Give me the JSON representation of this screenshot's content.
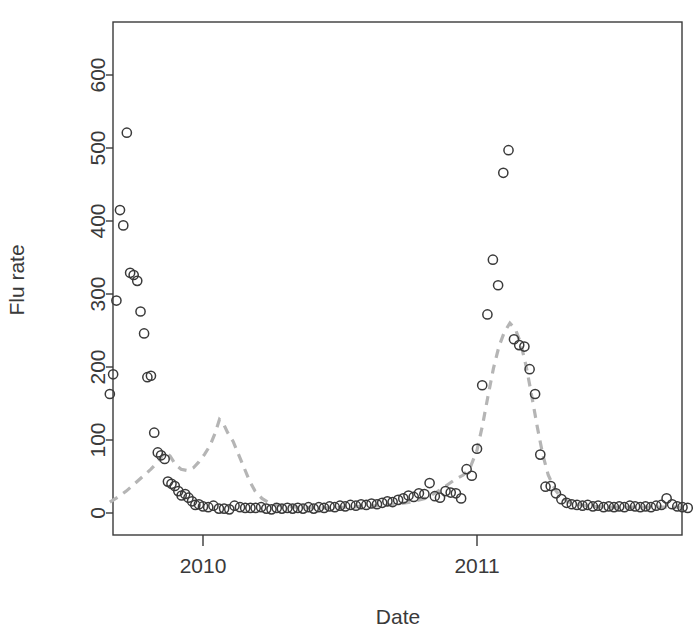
{
  "chart_data": {
    "type": "scatter",
    "title": "",
    "xlabel": "Date",
    "ylabel": "Flu rate",
    "xlim": [
      2009.63,
      2011.38
    ],
    "ylim": [
      -20,
      660
    ],
    "grid": false,
    "legend": "none",
    "x_tick_labels": [
      "2010",
      "2011"
    ],
    "x_tick_values": [
      2010,
      2011
    ],
    "y_tick_labels": [
      "0",
      "100",
      "200",
      "300",
      "400",
      "500",
      "600"
    ],
    "y_tick_values": [
      0,
      100,
      200,
      300,
      400,
      500,
      600
    ],
    "series": [
      {
        "name": "Observed flu rate",
        "type": "scatter",
        "marker": "open-circle",
        "color": "#3a3a3a",
        "points": [
          [
            2009.66,
            163
          ],
          [
            2009.672,
            190
          ],
          [
            2009.684,
            291
          ],
          [
            2009.697,
            415
          ],
          [
            2009.709,
            394
          ],
          [
            2009.722,
            521
          ],
          [
            2009.734,
            329
          ],
          [
            2009.747,
            326
          ],
          [
            2009.76,
            318
          ],
          [
            2009.772,
            276
          ],
          [
            2009.785,
            246
          ],
          [
            2009.797,
            186
          ],
          [
            2009.81,
            188
          ],
          [
            2009.822,
            110
          ],
          [
            2009.835,
            83
          ],
          [
            2009.847,
            79
          ],
          [
            2009.86,
            74
          ],
          [
            2009.872,
            43
          ],
          [
            2009.885,
            40
          ],
          [
            2009.897,
            37
          ],
          [
            2009.91,
            30
          ],
          [
            2009.922,
            24
          ],
          [
            2009.935,
            26
          ],
          [
            2009.947,
            21
          ],
          [
            2009.96,
            16
          ],
          [
            2009.972,
            11
          ],
          [
            2009.985,
            12
          ],
          [
            2010.0,
            9
          ],
          [
            2010.019,
            8
          ],
          [
            2010.038,
            10
          ],
          [
            2010.058,
            6
          ],
          [
            2010.077,
            6
          ],
          [
            2010.096,
            5
          ],
          [
            2010.115,
            10
          ],
          [
            2010.135,
            8
          ],
          [
            2010.154,
            7
          ],
          [
            2010.173,
            7
          ],
          [
            2010.192,
            7
          ],
          [
            2010.212,
            8
          ],
          [
            2010.231,
            6
          ],
          [
            2010.25,
            5
          ],
          [
            2010.269,
            7
          ],
          [
            2010.288,
            6
          ],
          [
            2010.308,
            7
          ],
          [
            2010.327,
            6
          ],
          [
            2010.346,
            7
          ],
          [
            2010.365,
            6
          ],
          [
            2010.385,
            8
          ],
          [
            2010.404,
            6
          ],
          [
            2010.423,
            8
          ],
          [
            2010.442,
            7
          ],
          [
            2010.462,
            9
          ],
          [
            2010.481,
            8
          ],
          [
            2010.5,
            10
          ],
          [
            2010.519,
            9
          ],
          [
            2010.538,
            11
          ],
          [
            2010.558,
            10
          ],
          [
            2010.577,
            12
          ],
          [
            2010.596,
            11
          ],
          [
            2010.615,
            13
          ],
          [
            2010.635,
            12
          ],
          [
            2010.654,
            14
          ],
          [
            2010.673,
            16
          ],
          [
            2010.692,
            15
          ],
          [
            2010.712,
            18
          ],
          [
            2010.731,
            20
          ],
          [
            2010.75,
            24
          ],
          [
            2010.769,
            22
          ],
          [
            2010.788,
            27
          ],
          [
            2010.808,
            26
          ],
          [
            2010.827,
            41
          ],
          [
            2010.846,
            23
          ],
          [
            2010.865,
            21
          ],
          [
            2010.885,
            30
          ],
          [
            2010.904,
            28
          ],
          [
            2010.923,
            27
          ],
          [
            2010.942,
            20
          ],
          [
            2010.962,
            60
          ],
          [
            2010.981,
            51
          ],
          [
            2011.0,
            88
          ],
          [
            2011.019,
            175
          ],
          [
            2011.038,
            272
          ],
          [
            2011.058,
            347
          ],
          [
            2011.077,
            312
          ],
          [
            2011.096,
            466
          ],
          [
            2011.115,
            497
          ],
          [
            2011.135,
            238
          ],
          [
            2011.154,
            230
          ],
          [
            2011.173,
            228
          ],
          [
            2011.192,
            197
          ],
          [
            2011.212,
            163
          ],
          [
            2011.231,
            80
          ],
          [
            2011.25,
            36
          ],
          [
            2011.269,
            37
          ],
          [
            2011.288,
            27
          ],
          [
            2011.308,
            19
          ],
          [
            2011.327,
            14
          ],
          [
            2011.346,
            12
          ],
          [
            2011.365,
            11
          ],
          [
            2011.385,
            10
          ],
          [
            2011.404,
            11
          ],
          [
            2011.423,
            9
          ],
          [
            2011.442,
            10
          ],
          [
            2011.462,
            8
          ],
          [
            2011.481,
            9
          ],
          [
            2011.5,
            8
          ],
          [
            2011.519,
            9
          ],
          [
            2011.538,
            8
          ],
          [
            2011.558,
            10
          ],
          [
            2011.577,
            9
          ],
          [
            2011.596,
            8
          ],
          [
            2011.615,
            9
          ],
          [
            2011.635,
            8
          ],
          [
            2011.654,
            10
          ],
          [
            2011.673,
            11
          ],
          [
            2011.692,
            20
          ],
          [
            2011.712,
            12
          ],
          [
            2011.731,
            9
          ],
          [
            2011.75,
            8
          ],
          [
            2011.769,
            7
          ]
        ]
      },
      {
        "name": "Predicted flu rate",
        "type": "line",
        "style": "dashed",
        "color": "#b5b5b5",
        "points": [
          [
            2009.66,
            15
          ],
          [
            2009.69,
            22
          ],
          [
            2009.72,
            30
          ],
          [
            2009.75,
            40
          ],
          [
            2009.78,
            50
          ],
          [
            2009.81,
            60
          ],
          [
            2009.84,
            72
          ],
          [
            2009.86,
            84
          ],
          [
            2009.88,
            78
          ],
          [
            2009.9,
            66
          ],
          [
            2009.92,
            60
          ],
          [
            2009.945,
            58
          ],
          [
            2009.965,
            62
          ],
          [
            2009.985,
            70
          ],
          [
            2010.005,
            80
          ],
          [
            2010.025,
            92
          ],
          [
            2010.045,
            110
          ],
          [
            2010.06,
            128
          ],
          [
            2010.075,
            122
          ],
          [
            2010.09,
            110
          ],
          [
            2010.11,
            98
          ],
          [
            2010.13,
            80
          ],
          [
            2010.15,
            62
          ],
          [
            2010.17,
            44
          ],
          [
            2010.19,
            30
          ],
          [
            2010.215,
            20
          ],
          [
            2010.24,
            14
          ],
          [
            2010.27,
            11
          ],
          [
            2010.3,
            9
          ],
          [
            2010.34,
            8
          ],
          [
            2010.4,
            7
          ],
          [
            2010.46,
            7
          ],
          [
            2010.52,
            8
          ],
          [
            2010.58,
            9
          ],
          [
            2010.64,
            10
          ],
          [
            2010.7,
            12
          ],
          [
            2010.76,
            15
          ],
          [
            2010.81,
            20
          ],
          [
            2010.85,
            28
          ],
          [
            2010.89,
            38
          ],
          [
            2010.92,
            46
          ],
          [
            2010.95,
            52
          ],
          [
            2010.975,
            62
          ],
          [
            2011.0,
            86
          ],
          [
            2011.02,
            120
          ],
          [
            2011.04,
            160
          ],
          [
            2011.06,
            198
          ],
          [
            2011.08,
            228
          ],
          [
            2011.1,
            248
          ],
          [
            2011.12,
            260
          ],
          [
            2011.14,
            252
          ],
          [
            2011.16,
            232
          ],
          [
            2011.18,
            200
          ],
          [
            2011.2,
            160
          ],
          [
            2011.22,
            118
          ],
          [
            2011.24,
            80
          ],
          [
            2011.26,
            52
          ],
          [
            2011.285,
            32
          ],
          [
            2011.31,
            20
          ],
          [
            2011.34,
            14
          ],
          [
            2011.38,
            11
          ],
          [
            2011.43,
            9
          ],
          [
            2011.49,
            8
          ],
          [
            2011.56,
            8
          ],
          [
            2011.63,
            8
          ],
          [
            2011.7,
            8
          ],
          [
            2011.769,
            8
          ]
        ]
      }
    ]
  },
  "axes": {
    "box_color": "#3a3a3a",
    "tick_color": "#3a3a3a"
  }
}
